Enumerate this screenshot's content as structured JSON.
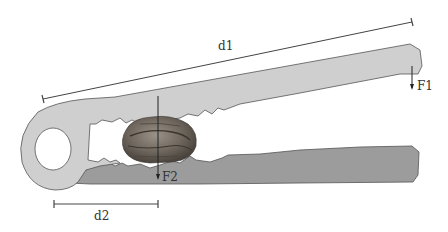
{
  "diagram": {
    "labels": {
      "d1": "d1",
      "d2": "d2",
      "F1": "F1",
      "F2": "F2"
    },
    "colors": {
      "upper_arm": "#cfcfcf",
      "lower_arm": "#9c9c9c",
      "outline": "#555555",
      "nut": "#7a7268",
      "dimension_line": "#444444",
      "background": "#ffffff"
    }
  }
}
